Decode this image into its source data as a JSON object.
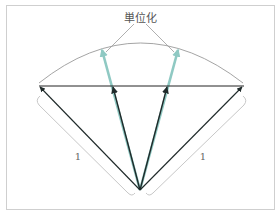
{
  "diagram": {
    "title_label": "単位化",
    "length_label_left": "1",
    "length_label_right": "1",
    "colors": {
      "frame": "#cfcfcf",
      "arc": "#9a9a9a",
      "baseline": "#222222",
      "vector": "#1f2a2a",
      "unit_vector": "#8fc9c3",
      "bracket": "#c8c8c8",
      "callout": "#9a9a9a"
    },
    "origin": [
      140,
      190
    ],
    "vectors": [
      {
        "name": "outer-left",
        "to": [
          40,
          87
        ]
      },
      {
        "name": "inner-left",
        "to": [
          113,
          87
        ]
      },
      {
        "name": "inner-right",
        "to": [
          167,
          87
        ]
      },
      {
        "name": "outer-right",
        "to": [
          242,
          87
        ]
      }
    ],
    "unit_vectors": [
      {
        "name": "unit-left",
        "to": [
          102,
          49
        ]
      },
      {
        "name": "unit-right",
        "to": [
          178,
          49
        ]
      }
    ]
  }
}
